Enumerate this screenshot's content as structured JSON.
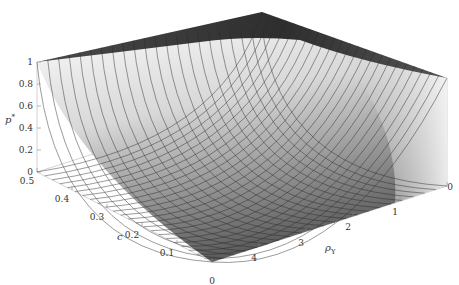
{
  "chart_data": {
    "type": "surface3d",
    "title": "",
    "axes": {
      "z": {
        "label": "p*",
        "ticks": [
          "0",
          "0.2",
          "0.4",
          "0.6",
          "0.8",
          "1"
        ],
        "range": [
          0,
          1
        ]
      },
      "c": {
        "label": "c",
        "ticks": [
          "0",
          "0.1",
          "0.2",
          "0.3",
          "0.4",
          "0.5"
        ],
        "range": [
          0,
          0.5
        ]
      },
      "rho": {
        "label": "ρY",
        "ticks": [
          "0",
          "1",
          "2",
          "3",
          "4"
        ],
        "range": [
          0,
          5
        ]
      }
    },
    "grid": true,
    "legend": null,
    "surface_samples": {
      "c": [
        0.5,
        0.4,
        0.3,
        0.2,
        0.1,
        0.0
      ],
      "rho_Y": [
        0,
        1,
        2,
        3,
        4,
        5
      ],
      "p_star": [
        [
          1.0,
          1.0,
          1.0,
          1.0,
          1.0,
          1.0
        ],
        [
          0.95,
          0.55,
          0.35,
          0.22,
          0.15,
          0.1
        ],
        [
          0.9,
          0.35,
          0.18,
          0.1,
          0.06,
          0.04
        ],
        [
          0.85,
          0.2,
          0.08,
          0.04,
          0.02,
          0.01
        ],
        [
          0.8,
          0.08,
          0.02,
          0.01,
          0.0,
          0.0
        ],
        [
          0.75,
          0.0,
          0.0,
          0.0,
          0.0,
          0.0
        ]
      ]
    }
  },
  "labels": {
    "z_axis": "p",
    "z_axis_sup": "*",
    "c_axis": "c",
    "rho_axis": "ρ",
    "rho_axis_sub": "Y"
  },
  "colors": {
    "plateau": "#3a3a3a",
    "surface_light": "#f4f4f4",
    "surface_dark": "#5a5a5a",
    "mesh": "#2a2a2a",
    "axis": "#9a9a9a"
  }
}
